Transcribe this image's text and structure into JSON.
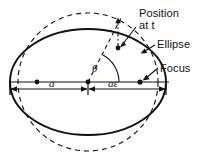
{
  "diagram": {
    "type": "geometric-diagram",
    "background_color": "#ffffff",
    "stroke_color": "#111111",
    "annotations": {
      "position_label": "Position\nat t",
      "ellipse_label": "Ellipse",
      "focus_label": "Focus",
      "angle_label": "θ",
      "semi_major_label": "a",
      "focal_offset_label": "aε"
    },
    "shapes": {
      "ellipse": {
        "name": "orbit-ellipse",
        "style": "solid",
        "center": [
          88,
          82
        ],
        "rx": 78,
        "ry": 53
      },
      "circle": {
        "name": "auxiliary-circle",
        "style": "dashed",
        "center": [
          88,
          82
        ],
        "r": 70
      },
      "major_axis": {
        "name": "major-axis-line",
        "from": [
          10,
          82
        ],
        "to": [
          168,
          82
        ]
      },
      "center_point": [
        37,
        82
      ],
      "focus_point": [
        140,
        82
      ],
      "angle_vertex": [
        88,
        82
      ],
      "position_point": [
        118,
        47
      ],
      "circle_point": [
        118,
        22
      ]
    },
    "dimension_line": {
      "name": "dimension-line",
      "y": 89,
      "left_end": 10,
      "mid": 88,
      "right_end": 166,
      "segments": [
        {
          "label": "a",
          "from": 10,
          "to": 88
        },
        {
          "label": "aε",
          "from": 88,
          "to": 166
        }
      ]
    }
  }
}
